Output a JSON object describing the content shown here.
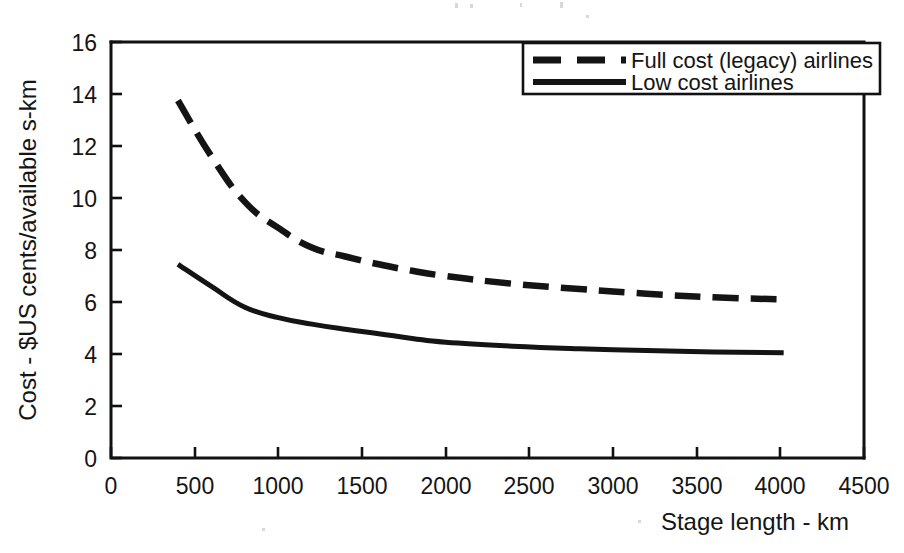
{
  "chart_data": {
    "type": "line",
    "title": "",
    "xlabel": "Stage length - km",
    "ylabel": "Cost - $US cents/available s-km",
    "xlim": [
      0,
      4500
    ],
    "ylim": [
      0,
      16
    ],
    "xticks": [
      "0",
      "500",
      "1000",
      "1500",
      "2000",
      "2500",
      "3000",
      "3500",
      "4000",
      "4500"
    ],
    "yticks": [
      "0",
      "2",
      "4",
      "6",
      "8",
      "10",
      "12",
      "14",
      "16"
    ],
    "grid": false,
    "legend_position": "top-right",
    "series": [
      {
        "name": "Full cost (legacy) airlines",
        "style": "dashed",
        "x": [
          400,
          600,
          800,
          1000,
          1200,
          1400,
          1600,
          1800,
          2000,
          2400,
          2800,
          3200,
          3600,
          4020
        ],
        "values": [
          13.75,
          11.6,
          9.85,
          8.85,
          8.1,
          7.75,
          7.45,
          7.2,
          7.0,
          6.7,
          6.5,
          6.32,
          6.18,
          6.1
        ]
      },
      {
        "name": "Low cost airlines",
        "style": "solid",
        "x": [
          400,
          600,
          800,
          1000,
          1200,
          1400,
          1600,
          1800,
          2000,
          2400,
          2800,
          3200,
          3600,
          4020
        ],
        "values": [
          7.45,
          6.6,
          5.8,
          5.4,
          5.15,
          4.95,
          4.78,
          4.6,
          4.45,
          4.3,
          4.2,
          4.13,
          4.08,
          4.05
        ]
      }
    ]
  },
  "legend": {
    "items": [
      {
        "label": "Full cost (legacy) airlines",
        "style": "dashed"
      },
      {
        "label": "Low cost airlines",
        "style": "solid"
      }
    ]
  },
  "axes": {
    "x_title": "Stage length - km",
    "y_title": "Cost - $US cents/available s-km"
  }
}
